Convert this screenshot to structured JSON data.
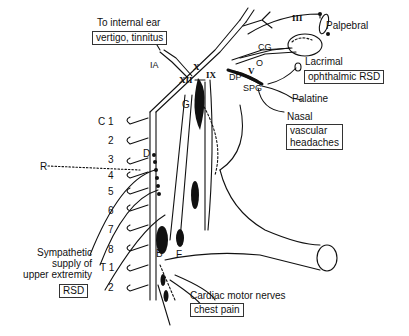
{
  "diagram": {
    "labels": {
      "internal_ear": "To internal ear",
      "vertigo": "vertigo, tinnitus",
      "palpebral": "Palpebral",
      "lacrimal": "Lacrimal",
      "ophthalmic_rsd": "ophthalmic RSD",
      "palatine": "Palatine",
      "nasal": "Nasal",
      "vascular_headaches_1": "vascular",
      "vascular_headaches_2": "headaches",
      "sympathetic_1": "Sympathetic",
      "sympathetic_2": "supply of",
      "sympathetic_3": "upper extremity",
      "rsd": "RSD",
      "cardiac": "Cardiac motor nerves",
      "chest_pain": "chest pain"
    },
    "markers": {
      "III": "III",
      "CG": "CG",
      "O": "O",
      "V": "V",
      "DP": "DP",
      "SPG": "SPG",
      "IA": "IA",
      "X": "X",
      "XII": "XII",
      "IX": "IX",
      "G": "G",
      "D": "D",
      "R": "R",
      "A": "A",
      "B": "B",
      "F": "F"
    },
    "vertebrae": [
      "C 1",
      "2",
      "3",
      "4",
      "5",
      "6",
      "7",
      "8",
      "T 1",
      "2"
    ]
  }
}
